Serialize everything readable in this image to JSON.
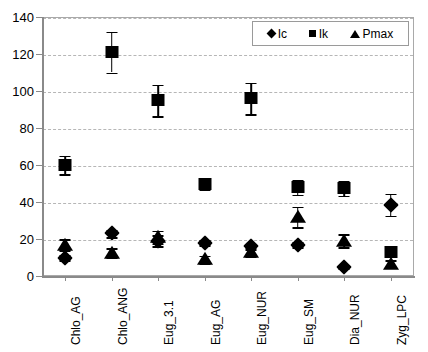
{
  "chart_data": {
    "type": "scatter",
    "title": "",
    "xlabel": "",
    "ylabel": "",
    "ylim": [
      0,
      140
    ],
    "yticks": [
      0,
      20,
      40,
      60,
      80,
      100,
      120,
      140
    ],
    "grid": true,
    "legend_position": "top-right",
    "categories": [
      "Chlo_AG",
      "Chlo_ANG",
      "Eug_3.1",
      "Eug_AG",
      "Eug_NUR",
      "Eug_SM",
      "Dia_NUR",
      "Zyg_LPC"
    ],
    "series": [
      {
        "name": "Ic",
        "marker": "diamond",
        "color": "#000000",
        "values": [
          10,
          23,
          19,
          18,
          16,
          17,
          5,
          38.5
        ],
        "errors": [
          1.5,
          2,
          3,
          1.5,
          1.5,
          1.5,
          1,
          6
        ]
      },
      {
        "name": "Ik",
        "marker": "square",
        "color": "#000000",
        "values": [
          60,
          121,
          95,
          50,
          96,
          48,
          47.5,
          13
        ],
        "errors": [
          5,
          11,
          8.5,
          3,
          8.5,
          4,
          4,
          2
        ]
      },
      {
        "name": "Pmax",
        "marker": "triangle",
        "color": "#000000",
        "values": [
          17,
          12.5,
          21,
          9,
          13,
          32,
          19,
          6.5
        ],
        "errors": [
          3,
          2.5,
          3.5,
          2,
          2.5,
          5.5,
          3.5,
          2
        ]
      }
    ]
  },
  "legend": {
    "items": [
      {
        "label": "Ic",
        "icon": "diamond-marker-icon"
      },
      {
        "label": "Ik",
        "icon": "square-marker-icon"
      },
      {
        "label": "Pmax",
        "icon": "triangle-marker-icon"
      }
    ]
  },
  "axis": {
    "y_tick_labels": [
      "0",
      "20",
      "40",
      "60",
      "80",
      "100",
      "120",
      "140"
    ],
    "x_tick_labels": [
      "Chlo_AG",
      "Chlo_ANG",
      "Eug_3.1",
      "Eug_AG",
      "Eug_NUR",
      "Eug_SM",
      "Dia_NUR",
      "Zyg_LPC"
    ]
  }
}
